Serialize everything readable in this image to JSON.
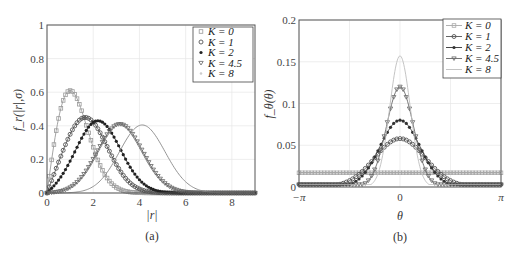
{
  "chart_data": [
    {
      "type": "line",
      "panel": "(a)",
      "title": "",
      "xlabel": "|r|",
      "ylabel": "f_r(|r|,σ)",
      "xlim": [
        0,
        9
      ],
      "ylim": [
        0,
        1
      ],
      "xticks": [
        "0",
        "2",
        "4",
        "6",
        "8"
      ],
      "yticks": [
        "0",
        "0.2",
        "0.4",
        "0.6",
        "0.8",
        "1"
      ],
      "grid": true,
      "legend_position": "upper right",
      "series": [
        {
          "name": "K = 0",
          "marker": "square",
          "color": "#9a9a9a",
          "peak_x": 1.0,
          "peak_y": 0.61,
          "shape": "rice",
          "nu": 0.0,
          "sigma": 1.0
        },
        {
          "name": "K = 1",
          "marker": "circle",
          "color": "#555555",
          "peak_x": 1.6,
          "peak_y": 0.45,
          "shape": "rice",
          "nu": 1.41,
          "sigma": 1.0
        },
        {
          "name": "K = 2",
          "marker": "dot",
          "color": "#222222",
          "peak_x": 2.2,
          "peak_y": 0.43,
          "shape": "rice",
          "nu": 2.0,
          "sigma": 1.0
        },
        {
          "name": "K = 4.5",
          "marker": "triangle-down",
          "color": "#666666",
          "peak_x": 3.1,
          "peak_y": 0.41,
          "shape": "rice",
          "nu": 3.0,
          "sigma": 1.0
        },
        {
          "name": "K = 8",
          "marker": "none",
          "color": "#888888",
          "peak_x": 4.1,
          "peak_y": 0.405,
          "shape": "rice",
          "nu": 4.0,
          "sigma": 1.0
        }
      ]
    },
    {
      "type": "line",
      "panel": "(b)",
      "title": "",
      "xlabel": "θ",
      "ylabel": "f_θ(θ)",
      "xlim": [
        -3.1416,
        3.1416
      ],
      "ylim": [
        0,
        0.2
      ],
      "xticks": [
        "−π",
        "0",
        "π"
      ],
      "yticks": [
        "0",
        "0.05",
        "0.1",
        "0.15",
        "0.2"
      ],
      "grid": true,
      "legend_position": "upper right",
      "series": [
        {
          "name": "K = 0",
          "marker": "square",
          "color": "#a8a8a8",
          "peak_y": 0.017,
          "width": 0
        },
        {
          "name": "K = 1",
          "marker": "circle",
          "color": "#555555",
          "peak_y": 0.058,
          "width": 0.78
        },
        {
          "name": "K = 2",
          "marker": "dot",
          "color": "#333333",
          "peak_y": 0.08,
          "width": 0.62
        },
        {
          "name": "K = 4.5",
          "marker": "triangle-down",
          "color": "#666666",
          "peak_y": 0.12,
          "width": 0.42
        },
        {
          "name": "K = 8",
          "marker": "none",
          "color": "#bdbdbd",
          "peak_y": 0.157,
          "width": 0.32
        }
      ]
    }
  ],
  "panels": {
    "a": {
      "caption": "(a)",
      "xlabel": "|r|",
      "ylabel": "f_r(|r|,σ)",
      "legend": [
        "K = 0",
        "K = 1",
        "K = 2",
        "K = 4.5",
        "K = 8"
      ]
    },
    "b": {
      "caption": "(b)",
      "xlabel": "θ",
      "ylabel": "f_θ(θ)",
      "legend": [
        "K = 0",
        "K = 1",
        "K = 2",
        "K = 4.5",
        "K = 8"
      ]
    }
  }
}
